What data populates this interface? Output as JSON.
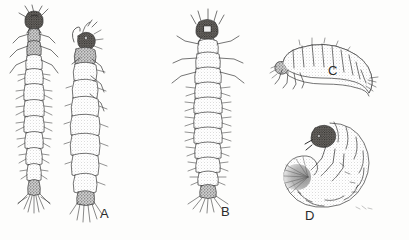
{
  "plate": {
    "title": "Insect larval types plate",
    "background_color": "#fdfdfc",
    "ink_color": "#333333",
    "medium": "pen-and-ink stipple line drawing",
    "width": 409,
    "height": 240
  },
  "figures": [
    {
      "label": "A",
      "name": "campodeiform-larva",
      "views": [
        "dorsal",
        "lateral"
      ],
      "description": "Elongate flattened larva shown in two views: dorsal at left with dark head capsule, three pairs of thoracic legs and bristled abdominal segments ending in paired cerci; lateral view at right with curved mandible and antenna.",
      "label_position": {
        "x": 100,
        "y": 207
      }
    },
    {
      "label": "B",
      "name": "elateriform-dorsal-larva",
      "views": [
        "dorsal"
      ],
      "description": "Dorsal view of a symmetrical larva with dark rounded head capsule, outspread legs, eight visible abdominal segments with lateral setae and a terminal tuft of long setae.",
      "label_position": {
        "x": 221,
        "y": 205
      }
    },
    {
      "label": "C",
      "name": "vermiform-lateral-larva",
      "views": [
        "lateral"
      ],
      "description": "Slender arched larva in lateral view, head and three pairs of short legs at lower left, body of uniform segments tapering to a setose tail at right.",
      "label_position": {
        "x": 328,
        "y": 64
      }
    },
    {
      "label": "D",
      "name": "scarabaeiform-grub",
      "views": [
        "lateral"
      ],
      "description": "C-shaped white grub in lateral view with heavily sclerotized dark head and mandibles, three pairs of thoracic legs, swollen segmented abdomen and a dense fan-shaped brush of setae at the left.",
      "label_position": {
        "x": 305,
        "y": 209
      }
    }
  ],
  "labels": {
    "a": "A",
    "b": "B",
    "c": "C",
    "d": "D"
  }
}
